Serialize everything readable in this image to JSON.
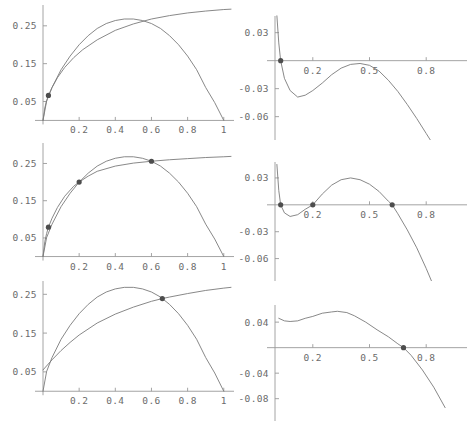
{
  "figure": {
    "background": "#ffffff",
    "curve_color": "#7a7a7a",
    "axis_color": "#9a9a9a",
    "marker_color": "#4d4d4d",
    "tick_label_color": "#6b6b6b",
    "layout": {
      "rows": 3,
      "cols": 2,
      "width": 467,
      "height": 421
    }
  },
  "chart_data": [
    {
      "id": "panel-top-left",
      "type": "line",
      "title": "",
      "xlabel": "",
      "ylabel": "",
      "xlim": [
        0,
        1.04
      ],
      "ylim": [
        -0.02,
        0.305
      ],
      "grid": false,
      "legend": null,
      "xticks": [
        0.2,
        0.4,
        0.6,
        0.8,
        1
      ],
      "xticklabels": [
        "0.2",
        "0.4",
        "0.6",
        "0.8",
        "1"
      ],
      "yticks": [
        0.05,
        0.15,
        0.25
      ],
      "yticklabels": [
        "0.05",
        "0.15",
        "0.25"
      ],
      "series": [
        {
          "name": "concave-upper-curve",
          "x": [
            0,
            0.01,
            0.02,
            0.03,
            0.05,
            0.08,
            0.12,
            0.17,
            0.22,
            0.3,
            0.4,
            0.5,
            0.6,
            0.7,
            0.8,
            0.9,
            1.0,
            1.04
          ],
          "values": [
            0,
            0.033,
            0.052,
            0.066,
            0.087,
            0.113,
            0.14,
            0.166,
            0.187,
            0.213,
            0.238,
            0.255,
            0.268,
            0.277,
            0.284,
            0.289,
            0.293,
            0.294
          ]
        },
        {
          "name": "parabola-curve",
          "x": [
            0,
            0.02,
            0.05,
            0.1,
            0.15,
            0.2,
            0.25,
            0.3,
            0.35,
            0.4,
            0.45,
            0.5,
            0.55,
            0.6,
            0.65,
            0.7,
            0.75,
            0.8,
            0.85,
            0.9,
            0.95,
            1.0
          ],
          "values": [
            0,
            0.051,
            0.087,
            0.134,
            0.17,
            0.2,
            0.224,
            0.243,
            0.256,
            0.264,
            0.268,
            0.268,
            0.264,
            0.256,
            0.243,
            0.224,
            0.2,
            0.17,
            0.134,
            0.087,
            0.047,
            0
          ]
        }
      ],
      "markers": [
        {
          "x": 0.03,
          "y": 0.066
        }
      ]
    },
    {
      "id": "panel-top-right",
      "type": "line",
      "title": "",
      "xlabel": "",
      "ylabel": "",
      "xlim": [
        0,
        1.0
      ],
      "ylim": [
        -0.085,
        0.05
      ],
      "grid": false,
      "legend": null,
      "xticks": [
        0.2,
        0.5,
        0.8
      ],
      "xticklabels": [
        "0.2",
        "0.5",
        "0.8"
      ],
      "yticks": [
        0.03,
        -0.03,
        -0.06
      ],
      "yticklabels": [
        "0.03",
        "-0.03",
        "-0.06"
      ],
      "series": [
        {
          "name": "difference-curve",
          "x": [
            0.01,
            0.02,
            0.03,
            0.05,
            0.08,
            0.12,
            0.16,
            0.2,
            0.25,
            0.3,
            0.35,
            0.4,
            0.45,
            0.5,
            0.55,
            0.6,
            0.65,
            0.7,
            0.75,
            0.8,
            0.85,
            0.9
          ],
          "values": [
            0.048,
            0.019,
            0.0,
            -0.019,
            -0.032,
            -0.039,
            -0.037,
            -0.032,
            -0.024,
            -0.015,
            -0.008,
            -0.004,
            -0.003,
            -0.005,
            -0.011,
            -0.021,
            -0.033,
            -0.047,
            -0.062,
            -0.078,
            -0.094,
            -0.111
          ]
        }
      ],
      "markers": [
        {
          "x": 0.03,
          "y": 0.0
        }
      ]
    },
    {
      "id": "panel-middle-left",
      "type": "line",
      "title": "",
      "xlabel": "",
      "ylabel": "",
      "xlim": [
        0,
        1.04
      ],
      "ylim": [
        -0.02,
        0.305
      ],
      "grid": false,
      "legend": null,
      "xticks": [
        0.2,
        0.4,
        0.6,
        0.8,
        1
      ],
      "xticklabels": [
        "0.2",
        "0.4",
        "0.6",
        "0.8",
        "1"
      ],
      "yticks": [
        0.05,
        0.15,
        0.25
      ],
      "yticklabels": [
        "0.05",
        "0.15",
        "0.25"
      ],
      "series": [
        {
          "name": "concave-upper-curve",
          "x": [
            0,
            0.01,
            0.02,
            0.03,
            0.05,
            0.08,
            0.12,
            0.17,
            0.2,
            0.25,
            0.3,
            0.4,
            0.5,
            0.6,
            0.7,
            0.8,
            0.9,
            1.0,
            1.04
          ],
          "values": [
            0,
            0.04,
            0.062,
            0.079,
            0.103,
            0.132,
            0.162,
            0.189,
            0.2,
            0.216,
            0.229,
            0.243,
            0.251,
            0.256,
            0.26,
            0.263,
            0.266,
            0.268,
            0.269
          ]
        },
        {
          "name": "parabola-curve",
          "x": [
            0,
            0.02,
            0.05,
            0.1,
            0.15,
            0.2,
            0.25,
            0.3,
            0.35,
            0.4,
            0.45,
            0.5,
            0.55,
            0.6,
            0.65,
            0.7,
            0.75,
            0.8,
            0.85,
            0.9,
            0.95,
            1.0
          ],
          "values": [
            0,
            0.051,
            0.087,
            0.134,
            0.17,
            0.2,
            0.224,
            0.243,
            0.256,
            0.264,
            0.268,
            0.268,
            0.264,
            0.256,
            0.243,
            0.224,
            0.2,
            0.17,
            0.134,
            0.087,
            0.047,
            0
          ]
        }
      ],
      "markers": [
        {
          "x": 0.03,
          "y": 0.079
        },
        {
          "x": 0.2,
          "y": 0.2
        },
        {
          "x": 0.6,
          "y": 0.256
        }
      ]
    },
    {
      "id": "panel-middle-right",
      "type": "line",
      "title": "",
      "xlabel": "",
      "ylabel": "",
      "xlim": [
        0,
        1.0
      ],
      "ylim": [
        -0.085,
        0.05
      ],
      "grid": false,
      "legend": null,
      "xticks": [
        0.2,
        0.5,
        0.8
      ],
      "xticklabels": [
        "0.2",
        "0.5",
        "0.8"
      ],
      "yticks": [
        0.03,
        -0.03,
        -0.06
      ],
      "yticklabels": [
        "0.03",
        "-0.03",
        "-0.06"
      ],
      "series": [
        {
          "name": "difference-curve",
          "x": [
            0.01,
            0.02,
            0.03,
            0.05,
            0.08,
            0.12,
            0.16,
            0.2,
            0.25,
            0.3,
            0.35,
            0.4,
            0.45,
            0.5,
            0.55,
            0.6,
            0.62,
            0.65,
            0.7,
            0.75,
            0.8,
            0.85
          ],
          "values": [
            0.045,
            0.016,
            0.0,
            -0.009,
            -0.013,
            -0.011,
            -0.005,
            0.0,
            0.012,
            0.022,
            0.028,
            0.03,
            0.028,
            0.023,
            0.015,
            0.004,
            0.0,
            -0.01,
            -0.028,
            -0.048,
            -0.071,
            -0.096
          ]
        }
      ],
      "markers": [
        {
          "x": 0.03,
          "y": 0.0
        },
        {
          "x": 0.2,
          "y": 0.0
        },
        {
          "x": 0.62,
          "y": 0.0
        }
      ]
    },
    {
      "id": "panel-bottom-left",
      "type": "line",
      "title": "",
      "xlabel": "",
      "ylabel": "",
      "xlim": [
        0,
        1.04
      ],
      "ylim": [
        -0.02,
        0.305
      ],
      "grid": false,
      "legend": null,
      "xticks": [
        0.2,
        0.4,
        0.6,
        0.8,
        1
      ],
      "xticklabels": [
        "0.2",
        "0.4",
        "0.6",
        "0.8",
        "1"
      ],
      "yticks": [
        0.05,
        0.15,
        0.25
      ],
      "yticklabels": [
        "0.05",
        "0.15",
        "0.25"
      ],
      "series": [
        {
          "name": "concave-upper-curve",
          "x": [
            0,
            0.05,
            0.1,
            0.15,
            0.2,
            0.3,
            0.4,
            0.5,
            0.6,
            0.66,
            0.7,
            0.8,
            0.9,
            1.0,
            1.04
          ],
          "values": [
            0.055,
            0.081,
            0.105,
            0.126,
            0.145,
            0.176,
            0.199,
            0.217,
            0.232,
            0.239,
            0.243,
            0.252,
            0.26,
            0.266,
            0.268
          ]
        },
        {
          "name": "parabola-curve",
          "x": [
            0,
            0.02,
            0.05,
            0.1,
            0.15,
            0.2,
            0.25,
            0.3,
            0.35,
            0.4,
            0.45,
            0.5,
            0.55,
            0.6,
            0.65,
            0.7,
            0.75,
            0.8,
            0.85,
            0.9,
            0.95,
            1.0
          ],
          "values": [
            0,
            0.051,
            0.087,
            0.134,
            0.17,
            0.2,
            0.224,
            0.243,
            0.256,
            0.264,
            0.268,
            0.268,
            0.264,
            0.256,
            0.243,
            0.224,
            0.2,
            0.17,
            0.134,
            0.087,
            0.047,
            0
          ]
        }
      ],
      "markers": [
        {
          "x": 0.66,
          "y": 0.239
        }
      ]
    },
    {
      "id": "panel-bottom-right",
      "type": "line",
      "title": "",
      "xlabel": "",
      "ylabel": "",
      "xlim": [
        0,
        1.0
      ],
      "ylim": [
        -0.115,
        0.07
      ],
      "grid": false,
      "legend": null,
      "xticks": [
        0.2,
        0.5,
        0.8
      ],
      "xticklabels": [
        "0.2",
        "0.5",
        "0.8"
      ],
      "yticks": [
        0.04,
        -0.04,
        -0.08
      ],
      "yticklabels": [
        "0.04",
        "-0.04",
        "-0.08"
      ],
      "series": [
        {
          "name": "difference-curve",
          "x": [
            0.02,
            0.05,
            0.08,
            0.12,
            0.16,
            0.2,
            0.25,
            0.3,
            0.33,
            0.38,
            0.42,
            0.48,
            0.54,
            0.6,
            0.65,
            0.68,
            0.72,
            0.78,
            0.84,
            0.9
          ],
          "values": [
            0.046,
            0.042,
            0.041,
            0.042,
            0.046,
            0.049,
            0.054,
            0.056,
            0.057,
            0.055,
            0.05,
            0.04,
            0.028,
            0.017,
            0.006,
            0.0,
            -0.012,
            -0.035,
            -0.062,
            -0.094
          ]
        }
      ],
      "markers": [
        {
          "x": 0.68,
          "y": 0.0
        }
      ]
    }
  ]
}
